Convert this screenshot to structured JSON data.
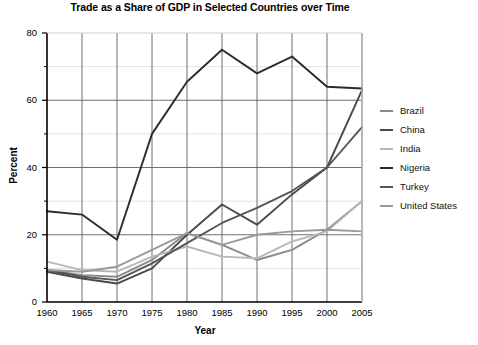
{
  "chart_data": {
    "type": "line",
    "title": "Trade as a Share of GDP in Selected Countries over Time",
    "xlabel": "Year",
    "ylabel": "Percent",
    "xlim": [
      1960,
      2005
    ],
    "ylim": [
      0,
      80
    ],
    "x": [
      1960,
      1965,
      1970,
      1975,
      1980,
      1985,
      1990,
      1995,
      2000,
      2005
    ],
    "xticks": [
      "1960",
      "1965",
      "1970",
      "1975",
      "1980",
      "1985",
      "1990",
      "1995",
      "2000",
      "2005"
    ],
    "yticks": [
      "0",
      "20",
      "40",
      "60",
      "80"
    ],
    "yticks_minor": [
      "10",
      "30",
      "50",
      "70"
    ],
    "grid": true,
    "legend_position": "right",
    "series": [
      {
        "name": "Brazil",
        "color": "#8a8a8a",
        "values": [
          9.5,
          8.0,
          7.5,
          12.5,
          20.5,
          17.0,
          12.5,
          15.5,
          21.5,
          30.0
        ]
      },
      {
        "name": "China",
        "color": "#4a4a4a",
        "values": [
          9.0,
          7.0,
          5.5,
          10.0,
          20.0,
          29.0,
          23.0,
          32.0,
          40.0,
          63.0
        ]
      },
      {
        "name": "India",
        "color": "#b8b8b8",
        "values": [
          12.0,
          9.5,
          9.0,
          13.5,
          16.5,
          13.5,
          13.0,
          18.0,
          21.0,
          30.0
        ]
      },
      {
        "name": "Nigeria",
        "color": "#2b2b2b",
        "values": [
          27.0,
          26.0,
          18.5,
          50.0,
          65.5,
          75.0,
          68.0,
          73.0,
          64.0,
          63.5
        ]
      },
      {
        "name": "Turkey",
        "color": "#555555",
        "values": [
          9.5,
          7.5,
          6.5,
          11.5,
          17.5,
          23.5,
          28.0,
          33.0,
          40.0,
          52.0
        ]
      },
      {
        "name": "United States",
        "color": "#9a9a9a",
        "values": [
          9.5,
          9.0,
          10.5,
          15.5,
          20.5,
          17.0,
          20.0,
          21.0,
          21.5,
          21.0
        ]
      }
    ]
  },
  "legend": {
    "items": [
      {
        "label": "Brazil"
      },
      {
        "label": "China"
      },
      {
        "label": "India"
      },
      {
        "label": "Nigeria"
      },
      {
        "label": "Turkey"
      },
      {
        "label": "United States"
      }
    ]
  }
}
